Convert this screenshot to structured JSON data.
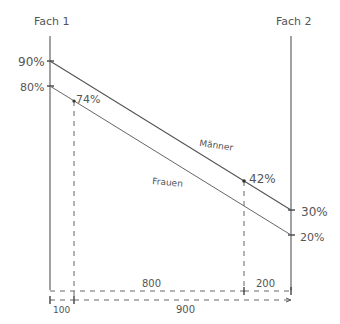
{
  "diagram": {
    "axes": {
      "left_label": "Fach 1",
      "right_label": "Fach 2"
    },
    "left_ticks": [
      {
        "label": "90%",
        "value": 90
      },
      {
        "label": "80%",
        "value": 80
      }
    ],
    "right_ticks": [
      {
        "label": "30%",
        "value": 30
      },
      {
        "label": "20%",
        "value": 20
      }
    ],
    "lines": [
      {
        "name": "Männer",
        "label": "Männer",
        "start": 90,
        "end": 30
      },
      {
        "name": "Frauen",
        "label": "Frauen",
        "start": 80,
        "end": 20
      }
    ],
    "points": [
      {
        "label": "74%",
        "value": 74
      },
      {
        "label": "42%",
        "value": 42
      }
    ],
    "dimensions": [
      {
        "label": "800"
      },
      {
        "label": "200"
      },
      {
        "label": "100"
      },
      {
        "label": "900"
      }
    ],
    "colors": {
      "ink": "#555555",
      "background": "#ffffff"
    }
  }
}
